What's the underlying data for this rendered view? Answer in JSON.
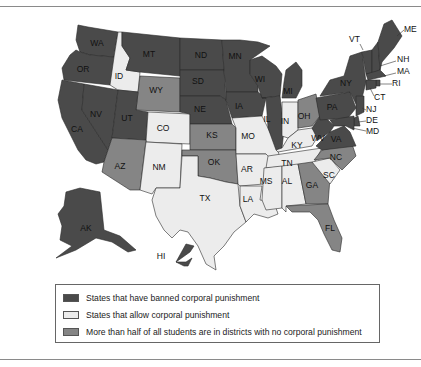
{
  "header": {
    "cut_text": ""
  },
  "colors": {
    "banned": "#4a4a4a",
    "allowed": "#ececec",
    "majority_no": "#858585",
    "border": "#2a2a2a"
  },
  "legend": {
    "items": [
      {
        "key": "banned",
        "label": "States that have banned corporal punishment"
      },
      {
        "key": "allowed",
        "label": "States that allow corporal punishment"
      },
      {
        "key": "majority_no",
        "label": "More than half of all students are in districts with no corporal punishment"
      }
    ]
  },
  "map": {
    "states": {
      "WA": "banned",
      "OR": "banned",
      "CA": "banned",
      "NV": "banned",
      "ID": "allowed",
      "MT": "banned",
      "WY": "majority_no",
      "UT": "banned",
      "CO": "allowed",
      "AZ": "majority_no",
      "NM": "allowed",
      "ND": "banned",
      "SD": "banned",
      "NE": "banned",
      "KS": "majority_no",
      "OK": "majority_no",
      "TX": "allowed",
      "MN": "banned",
      "IA": "banned",
      "MO": "allowed",
      "AR": "allowed",
      "LA": "allowed",
      "WI": "banned",
      "IL": "banned",
      "MI": "banned",
      "IN": "allowed",
      "OH": "majority_no",
      "KY": "allowed",
      "TN": "allowed",
      "MS": "allowed",
      "AL": "allowed",
      "GA": "majority_no",
      "FL": "majority_no",
      "SC": "allowed",
      "NC": "majority_no",
      "VA": "banned",
      "WV": "banned",
      "PA": "banned",
      "NY": "banned",
      "VT": "banned",
      "NH": "banned",
      "ME": "banned",
      "MA": "banned",
      "RI": "banned",
      "CT": "banned",
      "NJ": "banned",
      "DE": "banned",
      "MD": "banned",
      "AK": "banned",
      "HI": "banned"
    },
    "labels": {
      "WA": "WA",
      "OR": "OR",
      "CA": "CA",
      "NV": "NV",
      "ID": "ID",
      "MT": "MT",
      "WY": "WY",
      "UT": "UT",
      "CO": "CO",
      "AZ": "AZ",
      "NM": "NM",
      "ND": "ND",
      "SD": "SD",
      "NE": "NE",
      "KS": "KS",
      "OK": "OK",
      "TX": "TX",
      "MN": "MN",
      "IA": "IA",
      "MO": "MO",
      "AR": "AR",
      "LA": "LA",
      "WI": "WI",
      "IL": "IL",
      "MI": "MI",
      "IN": "IN",
      "OH": "OH",
      "KY": "KY",
      "TN": "TN",
      "MS": "MS",
      "AL": "AL",
      "GA": "GA",
      "FL": "FL",
      "SC": "SC",
      "NC": "NC",
      "VA": "VA",
      "WV": "WV",
      "PA": "PA",
      "NY": "NY",
      "VT": "VT",
      "NH": "NH",
      "ME": "ME",
      "MA": "MA",
      "RI": "RI",
      "CT": "CT",
      "NJ": "NJ",
      "DE": "DE",
      "MD": "MD",
      "AK": "AK",
      "HI": "HI"
    }
  }
}
